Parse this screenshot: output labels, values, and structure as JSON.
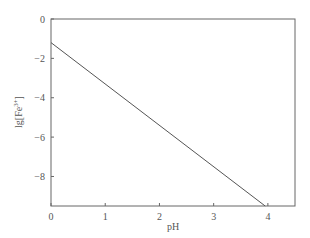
{
  "chart_data": {
    "type": "line",
    "title": "",
    "xlabel": "pH",
    "ylabel": "lg[Fe3+]",
    "ylabel_main": "lg[Fe",
    "ylabel_sup": "3+",
    "ylabel_close": "]",
    "xlim": [
      0,
      4.5
    ],
    "ylim": [
      -9.5,
      0
    ],
    "x_ticks": [
      0,
      1,
      2,
      3,
      4
    ],
    "x_tick_labels": [
      "0",
      "1",
      "2",
      "3",
      "4"
    ],
    "y_ticks": [
      0,
      -2,
      -4,
      -6,
      -8
    ],
    "y_tick_labels": [
      "0",
      "−2",
      "−4",
      "−6",
      "−8"
    ],
    "grid": false,
    "legend": null,
    "series": [
      {
        "name": "lg[Fe3+] vs pH",
        "x": [
          0,
          3.95
        ],
        "y": [
          -1.2,
          -9.5
        ],
        "color": "#555555"
      }
    ]
  }
}
